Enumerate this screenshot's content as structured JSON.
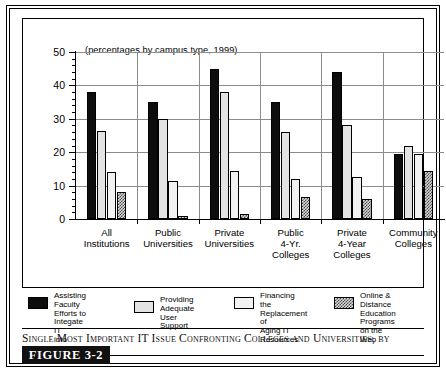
{
  "chart_data": {
    "type": "bar",
    "title": "Single Most Important IT Issue Confronting Colleges and Universities, by Sector",
    "subtitle": "(percentages by campus type, 1999)",
    "xlabel": "",
    "ylabel": "",
    "ylim": [
      0,
      50
    ],
    "yticks": [
      0,
      10,
      20,
      30,
      40,
      50
    ],
    "ytick_labels": [
      "0",
      "10",
      "20",
      "30",
      "40",
      "50"
    ],
    "minor_tick_step": 2,
    "grid": true,
    "legend_position": "below-plot",
    "categories": [
      "All Institutions",
      "Public Universities",
      "Private Universities",
      "Public 4-Yr. Colleges",
      "Private 4-Year Colleges",
      "Community Colleges"
    ],
    "category_lines": [
      [
        "All",
        "Institutions"
      ],
      [
        "Public",
        "Universities"
      ],
      [
        "Private",
        "Universities"
      ],
      [
        "Public",
        "4-Yr.",
        "Colleges"
      ],
      [
        "Private",
        "4-Year",
        "Colleges"
      ],
      [
        "Community",
        "Colleges"
      ]
    ],
    "series": [
      {
        "name": "Assisting Faculty Efforts to Integate IT into Instruction",
        "pattern": "solid-black",
        "values": [
          38,
          35,
          45,
          35,
          44,
          19.5
        ]
      },
      {
        "name": "Providing Adequate User Support",
        "pattern": "fine-dotted",
        "values": [
          26.5,
          30,
          38,
          26,
          28,
          22
        ]
      },
      {
        "name": "Financing the Replacement of Aging IT Resources",
        "pattern": "plain-light",
        "values": [
          14,
          11.5,
          14.5,
          12,
          12.5,
          19.5
        ]
      },
      {
        "name": "Online & Distance Education Programs on the Web",
        "pattern": "checkered",
        "values": [
          8,
          1,
          1.5,
          6.5,
          6,
          14.5
        ]
      }
    ]
  },
  "legend": [
    {
      "label_lines": [
        "Assisting Faculty",
        "Efforts to Integate IT",
        "into Instruction"
      ]
    },
    {
      "label_lines": [
        "Providing Adequate",
        "User Support"
      ]
    },
    {
      "label_lines": [
        "Financing the",
        "Replacement of",
        "Aging IT Resources"
      ]
    },
    {
      "label_lines": [
        "Online & Distance",
        "Education Programs",
        "on the Web"
      ]
    }
  ],
  "caption": {
    "text": "Single Most Important IT Issue Confronting Colleges and Universities, by Sector"
  },
  "figure_tag": {
    "label": "FIGURE 3-2"
  },
  "colors": {
    "series_1": "#0d0d0d",
    "series_2": "#e3e3e3",
    "series_3": "#f2f2f2",
    "series_4": "#d8d8d8",
    "gridline": "#8c8c8c",
    "border": "#000000",
    "figure_tag_bg": "#111111"
  }
}
